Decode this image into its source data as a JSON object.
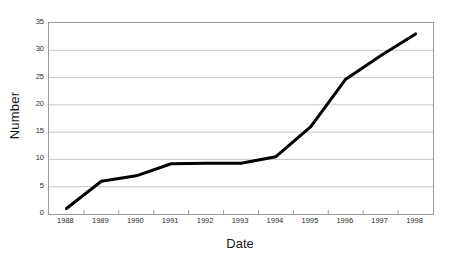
{
  "chart_data": {
    "type": "line",
    "title": "",
    "xlabel": "Date",
    "ylabel": "Number",
    "categories": [
      "1988",
      "1989",
      "1990",
      "1991",
      "1992",
      "1993",
      "1994",
      "1995",
      "1996",
      "1997",
      "1998"
    ],
    "values": [
      1,
      6,
      7,
      9.2,
      9.3,
      9.3,
      10.5,
      16,
      24.7,
      29,
      33
    ],
    "series": [
      {
        "name": "Number",
        "values": [
          1,
          6,
          7,
          9.2,
          9.3,
          9.3,
          10.5,
          16,
          24.7,
          29,
          33
        ],
        "color": "#000000"
      }
    ],
    "ylim": [
      0,
      35
    ],
    "y_ticks": [
      0,
      5,
      10,
      15,
      20,
      25,
      30,
      35
    ],
    "y_tick_labels": [
      "0",
      "5",
      "10",
      "15",
      "20",
      "25",
      "30",
      "35"
    ],
    "grid": "horizontal",
    "grid_color": "#c8c8c8",
    "legend": "none",
    "plot_border_color": "#9a9a9a",
    "background_color": "#ffffff",
    "line_width": 3,
    "markers": "none"
  }
}
